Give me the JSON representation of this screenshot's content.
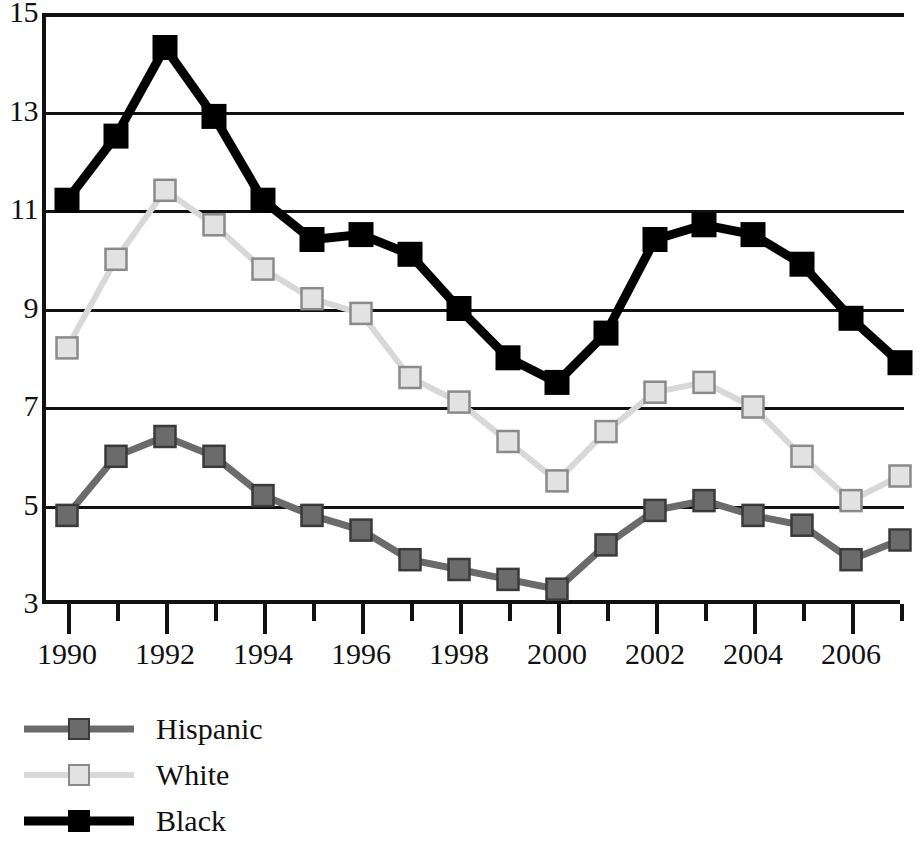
{
  "chart_data": {
    "type": "line",
    "title": "",
    "subtitle": "",
    "xlabel": "",
    "ylabel": "",
    "x": [
      1990,
      1991,
      1992,
      1993,
      1994,
      1995,
      1996,
      1997,
      1998,
      1999,
      2000,
      2001,
      2002,
      2003,
      2004,
      2005,
      2006,
      2007
    ],
    "xlim": [
      1990,
      2007
    ],
    "ylim": [
      3,
      15
    ],
    "yticks": [
      3,
      5,
      7,
      9,
      11,
      13,
      15
    ],
    "ytick_labels": [
      "3",
      "5",
      "7",
      "9",
      "11",
      "13",
      "15"
    ],
    "xticks_major": [
      1990,
      1992,
      1994,
      1996,
      1998,
      2000,
      2002,
      2004,
      2006
    ],
    "xtick_labels": [
      "1990",
      "1992",
      "1994",
      "1996",
      "1998",
      "2000",
      "2002",
      "2004",
      "2006"
    ],
    "xticks_minor": [
      1991,
      1993,
      1995,
      1997,
      1999,
      2001,
      2003,
      2005,
      2007
    ],
    "grid": true,
    "legend_position": "below-left",
    "series": [
      {
        "name": "Hispanic",
        "color": "#6b6b6b",
        "marker": "square-hatched",
        "values": [
          4.8,
          6.0,
          6.4,
          6.0,
          5.2,
          4.8,
          4.5,
          3.9,
          3.7,
          3.5,
          3.3,
          4.2,
          4.9,
          5.1,
          4.8,
          4.6,
          3.9,
          4.3
        ]
      },
      {
        "name": "White",
        "color": "#d8d8d8",
        "marker": "square-light",
        "values": [
          8.2,
          10.0,
          11.4,
          10.7,
          9.8,
          9.2,
          8.9,
          7.6,
          7.1,
          6.3,
          5.5,
          6.5,
          7.3,
          7.5,
          7.0,
          6.0,
          5.1,
          5.6
        ]
      },
      {
        "name": "Black",
        "color": "#000000",
        "marker": "square-solid",
        "values": [
          11.2,
          12.5,
          14.3,
          12.9,
          11.2,
          10.4,
          10.5,
          10.1,
          9.0,
          8.0,
          7.5,
          8.5,
          10.4,
          10.7,
          10.5,
          9.9,
          8.8,
          7.9
        ]
      }
    ]
  },
  "legend": {
    "items": [
      {
        "label": "Hispanic"
      },
      {
        "label": "White"
      },
      {
        "label": "Black"
      }
    ]
  }
}
